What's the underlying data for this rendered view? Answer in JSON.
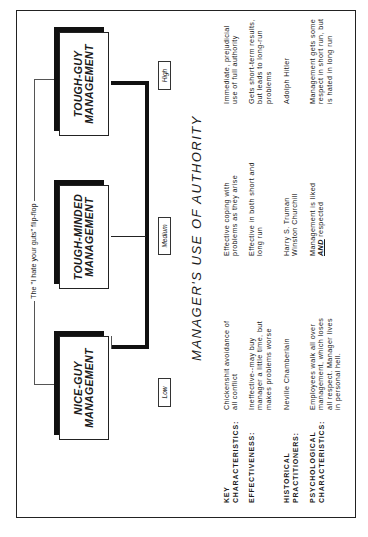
{
  "title": "MANAGER'S USE OF AUTHORITY",
  "flip_flop_label": "The \"I hate your guts\" flip-flop",
  "boxes": {
    "nice": {
      "line1": "NICE-GUY",
      "line2": "MANAGEMENT"
    },
    "minded": {
      "line1": "TOUGH-MINDED",
      "line2": "MANAGEMENT"
    },
    "tough": {
      "line1": "TOUGH-GUY",
      "line2": "MANAGEMENT"
    }
  },
  "levels": {
    "low": "Low",
    "medium": "Medium",
    "high": "High"
  },
  "rows": [
    {
      "label1": "KEY",
      "label2": "CHARACTERISTICS:",
      "nice": "Chickenshit avoidance of all conflict",
      "minded": "Effective coping with problems as they arise",
      "tough": "Immediate, prejudicial use of full authority"
    },
    {
      "label1": "EFFECTIVENESS:",
      "label2": "",
      "nice": "Ineffective--may buy manager a little time, but makes problems worse",
      "minded": "Effective in both short and long run",
      "tough": "Gets short-term results, but leads to long-run problems"
    },
    {
      "label1": "HISTORICAL",
      "label2": "PRACTITIONERS:",
      "nice": "Neville Chamberlain",
      "minded": "Harry S. Truman\nWinston Churchill",
      "tough": "Adolph Hitler"
    },
    {
      "label1": "PSYCHOLOGICAL",
      "label2": "CHARACTERISTICS:",
      "nice": "Employees walk all over management, which loses all respect. Manager lives in personal hell.",
      "minded_pre": "Management is liked",
      "minded_em": "AND",
      "minded_post": "respected",
      "tough": "Management gets some respect in short run, but is hated in long run"
    }
  ]
}
